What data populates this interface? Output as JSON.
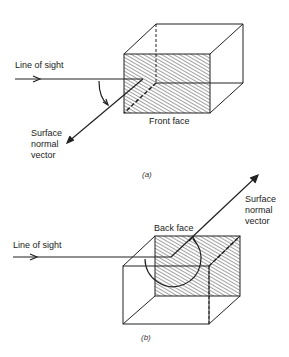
{
  "figure_a": {
    "line_of_sight": "Line of sight",
    "normal_line1": "Surface",
    "normal_line2": "normal",
    "normal_line3": "vector",
    "face_label": "Front face",
    "caption": "(a)"
  },
  "figure_b": {
    "line_of_sight": "Line of sight",
    "normal_line1": "Surface",
    "normal_line2": "normal",
    "normal_line3": "vector",
    "face_label": "Back face",
    "caption": "(b)"
  }
}
